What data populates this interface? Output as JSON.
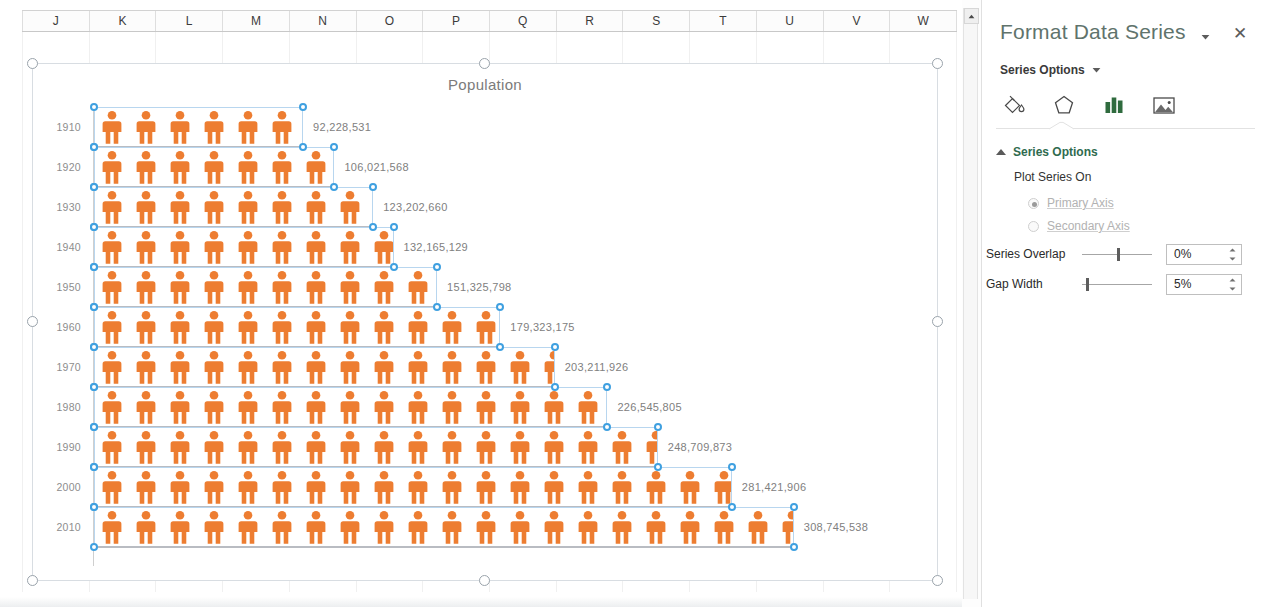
{
  "spreadsheet": {
    "column_headers": [
      "J",
      "K",
      "L",
      "M",
      "N",
      "O",
      "P",
      "Q",
      "R",
      "S",
      "T",
      "U",
      "V",
      "W"
    ]
  },
  "chart": {
    "title": "Population",
    "selected": true
  },
  "chart_data": {
    "type": "bar",
    "title": "Population",
    "xlabel": "",
    "ylabel": "",
    "orientation": "horizontal",
    "icon": "person-pictograph",
    "units_per_icon": 15000000,
    "categories": [
      "1910",
      "1920",
      "1930",
      "1940",
      "1950",
      "1960",
      "1970",
      "1980",
      "1990",
      "2000",
      "2010"
    ],
    "values": [
      92228531,
      106021568,
      123202660,
      132165129,
      151325798,
      179323175,
      203211926,
      226545805,
      248709873,
      281421906,
      308745538
    ],
    "value_labels": [
      "92,228,531",
      "106,021,568",
      "123,202,660",
      "132,165,129",
      "151,325,798",
      "179,323,175",
      "203,211,926",
      "226,545,805",
      "248,709,873",
      "281,421,906",
      "308,745,538"
    ],
    "icon_counts": [
      6.15,
      7.07,
      8.21,
      8.81,
      10.09,
      11.95,
      13.55,
      15.1,
      16.58,
      18.76,
      20.58
    ],
    "series_color": "#ED7D31",
    "grid": false,
    "legend": "none",
    "xlim": [
      0,
      320000000
    ]
  },
  "scrollbar": {
    "up_arrow_icon": "chevron-up-icon"
  },
  "pane": {
    "title": "Format Data Series",
    "menu_icon": "chevron-down-icon",
    "close_icon": "close-icon",
    "series_options_dropdown": {
      "label": "Series Options",
      "icon": "chevron-down-icon"
    },
    "tabs": [
      {
        "name": "fill-line-tab",
        "icon": "paint-bucket-icon",
        "active": false
      },
      {
        "name": "effects-tab",
        "icon": "pentagon-icon",
        "active": false
      },
      {
        "name": "series-options-tab",
        "icon": "bar-chart-icon",
        "active": true
      },
      {
        "name": "picture-tab",
        "icon": "picture-icon",
        "active": false
      }
    ],
    "active_tab_color": "#2F6B3E",
    "section": {
      "heading": "Series Options",
      "sub_heading": "Plot Series On",
      "radios": [
        {
          "label": "Primary Axis",
          "checked": true
        },
        {
          "label": "Secondary Axis",
          "checked": false
        }
      ],
      "sliders": [
        {
          "label": "Series Overlap",
          "value": "0%",
          "thumb_pct": 50
        },
        {
          "label": "Gap Width",
          "value": "5%",
          "thumb_pct": 5
        }
      ]
    }
  }
}
